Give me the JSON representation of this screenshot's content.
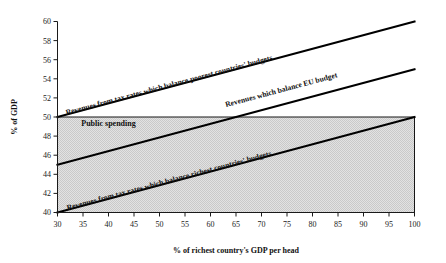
{
  "chart_data": {
    "type": "line",
    "title": "",
    "subtitle": "",
    "xlabel": "% of richest country's GDP per head",
    "ylabel": "% of GDP",
    "xlim": [
      30,
      100
    ],
    "ylim": [
      40,
      60
    ],
    "xticks": [
      30,
      35,
      40,
      45,
      50,
      55,
      60,
      65,
      70,
      75,
      80,
      85,
      90,
      95,
      100
    ],
    "yticks": [
      40,
      42,
      44,
      46,
      48,
      50,
      52,
      54,
      56,
      58,
      60
    ],
    "xticklabels": [
      "30",
      "35",
      "40",
      "45",
      "50",
      "55",
      "60",
      "65",
      "70",
      "75",
      "80",
      "85",
      "90",
      "95",
      "100"
    ],
    "yticklabels": [
      "40",
      "42",
      "44",
      "46",
      "48",
      "50",
      "52",
      "54",
      "56",
      "58",
      "60"
    ],
    "grid": false,
    "legend": "inline-labels",
    "x": [
      30,
      100
    ],
    "series": [
      {
        "name": "Revenues from tax rates which balance poorest countries' budgets",
        "values": [
          50,
          60
        ],
        "label_x": 52,
        "label_y": 53.1
      },
      {
        "name": "Revenues which balance EU budget",
        "values": [
          45,
          55
        ],
        "label_x": 74,
        "label_y": 52.6
      },
      {
        "name": "Revenues from tax rates which balance richest countries' budgets",
        "values": [
          40,
          50
        ],
        "label_x": 52,
        "label_y": 43.1
      }
    ],
    "regions": [
      {
        "name": "Public spending",
        "label": "Public spending",
        "x_range": [
          30,
          100
        ],
        "y_range": [
          40,
          50
        ],
        "fill": "#d9d9d9",
        "label_x": 40,
        "label_y": 49.1
      }
    ],
    "annotations": []
  },
  "colors": {
    "line": "#000000",
    "axis": "#1a1a1a",
    "region_fill": "#d9d9d9",
    "background": "#ffffff"
  }
}
